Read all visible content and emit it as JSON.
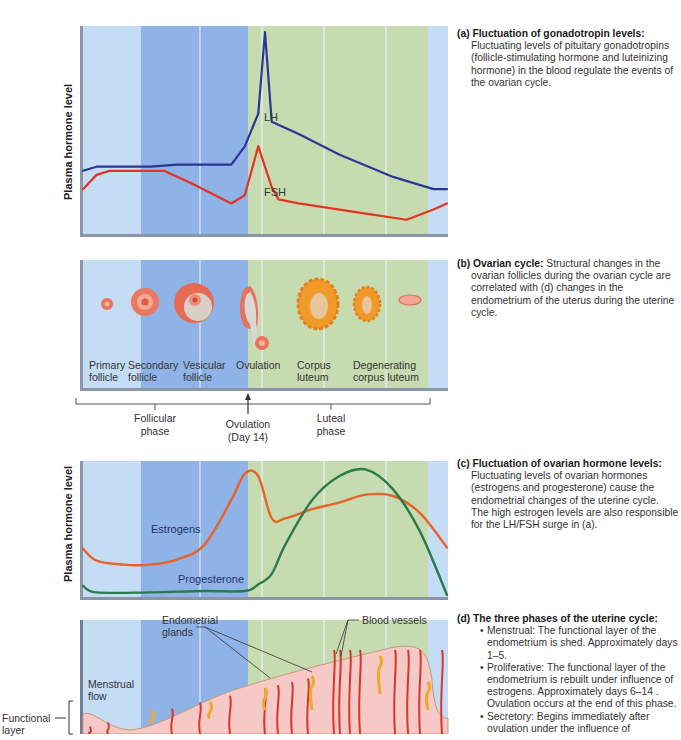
{
  "colors": {
    "menstrual_bg": "#c5dcf5",
    "proliferative_bg": "#8fb3e6",
    "secretory_bg": "#c6dcb0",
    "divider": "#eef4ff",
    "lh": "#2b3794",
    "fsh": "#e53320",
    "estrogens": "#e8622a",
    "progesterone": "#2a7a4c",
    "endometrium": "#f7c9c6",
    "vessel": "#d8342e",
    "gland": "#eeaa2a"
  },
  "panel_a": {
    "ylabel": "Plasma hormone level",
    "lh_label": "LH",
    "fsh_label": "FSH"
  },
  "panel_b": {
    "stages": [
      {
        "line1": "Primary",
        "line2": "follicle"
      },
      {
        "line1": "Secondary",
        "line2": "follicle"
      },
      {
        "line1": "Vesicular",
        "line2": "follicle"
      },
      {
        "line1": "Ovulation",
        "line2": ""
      },
      {
        "line1": "Corpus",
        "line2": "luteum"
      },
      {
        "line1": "Degenerating",
        "line2": "corpus luteum"
      }
    ],
    "phases": {
      "follicular_1": "Follicular",
      "follicular_2": "phase",
      "ovulation_1": "Ovulation",
      "ovulation_2": "(Day 14)",
      "luteal_1": "Luteal",
      "luteal_2": "phase"
    }
  },
  "panel_c": {
    "ylabel": "Plasma hormone level",
    "estrogens_label": "Estrogens",
    "progesterone_label": "Progesterone"
  },
  "panel_d": {
    "glands_label_1": "Endometrial",
    "glands_label_2": "glands",
    "vessels_label": "Blood vessels",
    "menstrual_1": "Menstrual",
    "menstrual_2": "flow",
    "functional_1": "Functional",
    "functional_2": "layer"
  },
  "captions": {
    "a": {
      "head": "(a) Fluctuation of gonadotropin levels:",
      "body": "Fluctuating levels of pituitary gonadotropins (follicle-stimulating hormone and luteinizing hormone) in the blood regulate the events of the ovarian cycle."
    },
    "b": {
      "head": "(b) Ovarian cycle:",
      "body": " Structural changes in the ovarian follicles during the ovarian cycle are correlated with (d) changes in the endometrium of the uterus during the uterine cycle."
    },
    "c": {
      "head": "(c) Fluctuation of ovarian hormone levels:",
      "body": "Fluctuating levels of ovarian hormones (estrogens and progesterone) cause the endometrial changes of the uterine cycle. The high estrogen levels are also responsible for the LH/FSH surge in (a)."
    },
    "d": {
      "head": "(d) The three phases of the uterine cycle:",
      "items": [
        "Menstrual: The functional layer of the endometrium is shed. Approximately days 1–5.",
        "Proliferative: The functional layer of the endometrium is rebuilt under influence of estrogens. Approximately days 6–14 . Ovulation occurs at the end of this phase.",
        "Secretory: Begins immediately after ovulation under the influence of"
      ]
    }
  },
  "chart_data": [
    {
      "type": "line",
      "title": "Fluctuation of gonadotropin levels",
      "xlabel": "Day of cycle",
      "ylabel": "Plasma hormone level",
      "xlim": [
        1,
        28
      ],
      "ylim": [
        0,
        100
      ],
      "grid": false,
      "series": [
        {
          "name": "LH",
          "x": [
            1,
            2,
            6,
            8,
            12,
            13,
            14,
            14.5,
            15,
            17,
            20,
            24,
            27,
            28
          ],
          "y": [
            30,
            32,
            32,
            33,
            33,
            42,
            58,
            98,
            54,
            48,
            38,
            27,
            21,
            21
          ]
        },
        {
          "name": "FSH",
          "x": [
            1,
            2,
            3,
            7,
            9,
            12,
            13,
            14,
            15,
            15.5,
            17,
            21,
            25,
            27,
            28
          ],
          "y": [
            21,
            28,
            30,
            30,
            24,
            14,
            18,
            42,
            22,
            16,
            14,
            10,
            6,
            11,
            14
          ]
        }
      ]
    },
    {
      "type": "line",
      "title": "Fluctuation of ovarian hormone levels",
      "xlabel": "Day of cycle",
      "ylabel": "Plasma hormone level",
      "xlim": [
        1,
        28
      ],
      "ylim": [
        0,
        100
      ],
      "grid": false,
      "series": [
        {
          "name": "Estrogens",
          "x": [
            1,
            2,
            4,
            6,
            8,
            10,
            12,
            13,
            14,
            15,
            16,
            18,
            20,
            22,
            24,
            26,
            28
          ],
          "y": [
            35,
            26,
            23,
            23,
            27,
            38,
            72,
            92,
            90,
            58,
            58,
            65,
            70,
            76,
            75,
            62,
            36
          ]
        },
        {
          "name": "Progesterone",
          "x": [
            1,
            2,
            6,
            10,
            13,
            14,
            15,
            16,
            18,
            20,
            22,
            24,
            26,
            28
          ],
          "y": [
            7,
            2,
            2,
            3,
            3,
            8,
            16,
            38,
            72,
            90,
            95,
            80,
            48,
            0
          ]
        }
      ]
    }
  ]
}
